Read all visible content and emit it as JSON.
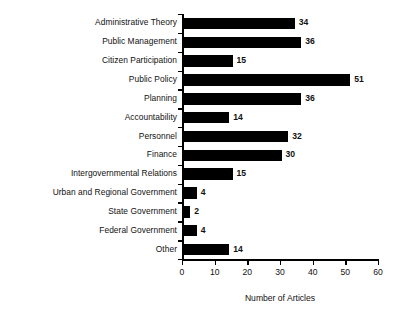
{
  "chart_data": {
    "type": "bar",
    "orientation": "horizontal",
    "title": "",
    "xlabel": "Number of Articles",
    "ylabel": "",
    "xlim": [
      0,
      60
    ],
    "xticks": [
      0,
      10,
      20,
      30,
      40,
      50,
      60
    ],
    "grid": false,
    "legend": null,
    "bar_color": "#000000",
    "value_labels": true,
    "categories": [
      "Administrative Theory",
      "Public Management",
      "Citizen Participation",
      "Public Policy",
      "Planning",
      "Accountability",
      "Personnel",
      "Finance",
      "Intergovernmental Relations",
      "Urban and Regional Government",
      "State Government",
      "Federal Government",
      "Other"
    ],
    "values": [
      34,
      36,
      15,
      51,
      36,
      14,
      32,
      30,
      15,
      4,
      2,
      4,
      14
    ]
  },
  "axis": {
    "x_title": "Number of Articles",
    "tick_labels": [
      "0",
      "10",
      "20",
      "30",
      "40",
      "50",
      "60"
    ]
  }
}
